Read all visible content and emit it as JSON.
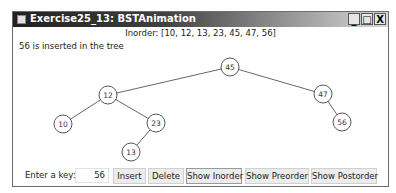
{
  "window": {
    "title": "Exercise25_13: BSTAnimation",
    "controls": {
      "minimize": "_",
      "maximize": "□",
      "close": "X"
    }
  },
  "inorder_text": "Inorder: [10, 12, 13, 23, 45, 47, 56]",
  "status_text": "56 is inserted in the tree",
  "tree": {
    "nodes": [
      {
        "key": "45",
        "x": 229,
        "y": 66
      },
      {
        "key": "12",
        "x": 107,
        "y": 94
      },
      {
        "key": "47",
        "x": 322,
        "y": 93
      },
      {
        "key": "10",
        "x": 62,
        "y": 123
      },
      {
        "key": "23",
        "x": 155,
        "y": 122
      },
      {
        "key": "56",
        "x": 341,
        "y": 121
      },
      {
        "key": "13",
        "x": 130,
        "y": 151
      }
    ],
    "edges": [
      [
        "45",
        "12"
      ],
      [
        "45",
        "47"
      ],
      [
        "12",
        "10"
      ],
      [
        "12",
        "23"
      ],
      [
        "23",
        "13"
      ],
      [
        "47",
        "56"
      ]
    ]
  },
  "controls": {
    "key_label": "Enter a key:",
    "key_value": "56",
    "insert": "Insert",
    "delete": "Delete",
    "show_inorder": "Show Inorder",
    "show_preorder": "Show Preorder",
    "show_postorder": "Show Postorder"
  }
}
